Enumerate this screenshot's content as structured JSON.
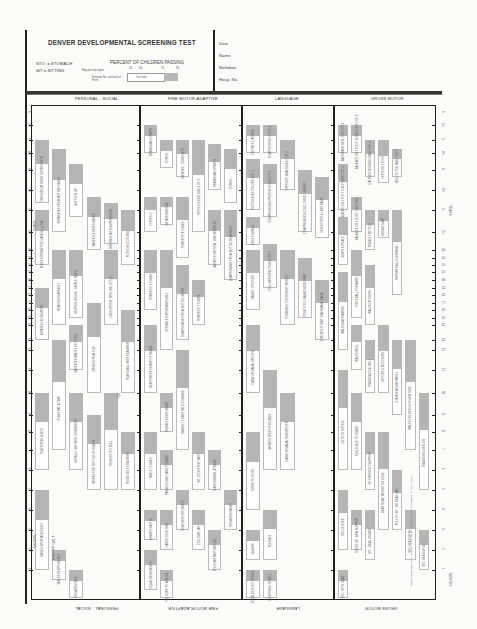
{
  "header": {
    "title": "DENVER DEVELOPMENTAL SCREENING TEST",
    "abbreviations": [
      "STO. = STOMACH",
      "SIT = SITTING"
    ],
    "legend": {
      "title": "PERCENT OF CHILDREN PASSING",
      "percentiles": [
        "25",
        "50",
        "75",
        "90"
      ],
      "report_note": "May pass by report",
      "footnote_note": "Footnote No. see back of Form",
      "test_item_label": "Test Item"
    },
    "fields": [
      "Date",
      "Name",
      "Birthdate",
      "Hosp. No."
    ]
  },
  "sections": [
    {
      "id": "personal-social",
      "label": "PERSONAL - SOCIAL"
    },
    {
      "id": "fine-motor-adaptive",
      "label": "FINE MOTOR-ADAPTIVE"
    },
    {
      "id": "language",
      "label": "LANGUAGE"
    },
    {
      "id": "gross-motor",
      "label": "GROSS MOTOR"
    }
  ],
  "axis": {
    "unit_top": "YEARS",
    "unit_bottom": "MONTHS",
    "year_ticks": [
      "6",
      "5½",
      "5",
      "4½",
      "4",
      "3½",
      "3",
      "2½"
    ],
    "month_ticks": [
      "24",
      "23",
      "22",
      "21",
      "20",
      "19",
      "18",
      "17",
      "16",
      "15",
      "14",
      "13",
      "12",
      "11",
      "10",
      "9",
      "8",
      "7",
      "6",
      "5",
      "4",
      "3",
      "2",
      "1"
    ]
  },
  "footnotes": {
    "ps_note": "★ 100% pass at birth",
    "ps_pct": "50%",
    "copyright": "©1969, William K. Frankenburg, M.D. and Josiah B. Dodds, Ph.D., University of Colorado Medical Center"
  },
  "chart_data": {
    "type": "table",
    "title": "DENVER DEVELOPMENTAL SCREENING TEST",
    "xlabel": "Age (months / years)",
    "note": "Each item is a bar showing age at which 25%, 50%, 75%, 90% of children pass (approx. months)",
    "items": {
      "personal_social": [
        {
          "label": "DRESSES WITHOUT SUPERVISION",
          "p25": 38,
          "p90": 60
        },
        {
          "label": "SEPARATES FROM MOTHER EASILY",
          "p25": 30,
          "p90": 56
        },
        {
          "label": "BUTTONS UP",
          "p25": 34,
          "p90": 50
        },
        {
          "label": "PLAYS INTERACTIVE GAMES e.g. TAG",
          "p25": 22,
          "p90": 36
        },
        {
          "label": "DRESSES WITH SUPERVISION",
          "p25": 26,
          "p90": 38
        },
        {
          "label": "WASHES & DRIES HANDS",
          "p25": 24,
          "p90": 40
        },
        {
          "label": "PUTS ON CLOTHING",
          "p25": 22,
          "p90": 36
        },
        {
          "label": "REMOVES GARMENT",
          "p25": 14,
          "p90": 24
        },
        {
          "label": "HELPS IN HOUSE - SIMPLE TASKS",
          "p25": 15,
          "p90": 24
        },
        {
          "label": "USES SPOON, SPILLING LITTLE",
          "p25": 14,
          "p90": 24
        },
        {
          "label": "IMITATES HOUSEWORK",
          "p25": 13,
          "p90": 19
        },
        {
          "label": "INDICATES WANTS (NOT CRY)",
          "p25": 11,
          "p90": 14
        },
        {
          "label": "PLAYS BALL WITH EXAMINER",
          "p25": 10,
          "p90": 16
        },
        {
          "label": "DRINKS FROM CUP",
          "p25": 10,
          "p90": 17
        },
        {
          "label": "PLAYS PAT-A-CAKE",
          "p25": 7,
          "p90": 13
        },
        {
          "label": "PLAYS PEEK-A-BOO",
          "p25": 6,
          "p90": 10
        },
        {
          "label": "INITIALLY SHY WITH STRANGERS",
          "p25": 6,
          "p90": 10
        },
        {
          "label": "RESISTS TOY PULL",
          "p25": 5,
          "p90": 10
        },
        {
          "label": "FEEDS SELF CRACKERS",
          "p25": 5,
          "p90": 8
        },
        {
          "label": "WORKS FOR TOY OUT OF REACH",
          "p25": 5,
          "p90": 9
        },
        {
          "label": "SMILES SPONTANEOUSLY",
          "p25": 1,
          "p90": 5
        },
        {
          "label": "SMILES RESPONSIVELY",
          "p25": 0.5,
          "p90": 2
        },
        {
          "label": "REGARDS FACE",
          "p25": 0,
          "p90": 1
        }
      ],
      "fine_motor_adaptive": [
        {
          "label": "DRAWS MAN 6 PARTS",
          "p25": 54,
          "p90": 66
        },
        {
          "label": "COPIES □",
          "p25": 52,
          "p90": 60
        },
        {
          "label": "IMITATES □ DEMONSTR.",
          "p25": 46,
          "p90": 60
        },
        {
          "label": "DRAWS MAN 3 PARTS",
          "p25": 42,
          "p90": 58
        },
        {
          "label": "PICKS LONGER LINE 3 OF 3",
          "p25": 30,
          "p90": 60
        },
        {
          "label": "COPIES +",
          "p25": 38,
          "p90": 56
        },
        {
          "label": "COPIES O",
          "p25": 30,
          "p90": 40
        },
        {
          "label": "IMITATES BRIDGE",
          "p25": 32,
          "p90": 40
        },
        {
          "label": "TOWER OF 8 CUBES",
          "p25": 23,
          "p90": 40
        },
        {
          "label": "IMITATES VERTICAL LINE WITHIN 30°",
          "p25": 22,
          "p90": 36
        },
        {
          "label": "DUMPS RAISIN FROM BOTTLE-DEMONSTR.",
          "p25": 20,
          "p90": 36
        },
        {
          "label": "TOWER OF 4 CUBES",
          "p25": 16,
          "p90": 24
        },
        {
          "label": "DUMPS RAISIN FROM BOTTLE-SPONT.",
          "p25": 13,
          "p90": 22
        },
        {
          "label": "TOWER OF 2 CUBES",
          "p25": 14,
          "p90": 20
        },
        {
          "label": "SCRIBBLES SPONTANEOUSLY",
          "p25": 12,
          "p90": 24
        },
        {
          "label": "NEAT PINCER GRASP OF RAISIN",
          "p25": 10,
          "p90": 14
        },
        {
          "label": "BANGS 2 CUBES HELD IN HANDS",
          "p25": 7,
          "p90": 12
        },
        {
          "label": "THUMB-FINGER GRASP",
          "p25": 8,
          "p90": 10
        },
        {
          "label": "PASSES CUBE HAND TO HAND",
          "p25": 5,
          "p90": 7
        },
        {
          "label": "TAKES 2 CUBES",
          "p25": 5,
          "p90": 8
        },
        {
          "label": "SIT, LOOKS FOR YARN",
          "p25": 5,
          "p90": 8
        },
        {
          "label": "RAKES RAISIN, ATTAINS",
          "p25": 5,
          "p90": 7
        },
        {
          "label": "GRASPS RATTLE",
          "p25": 2.5,
          "p90": 4
        },
        {
          "label": "REACHES FOR OBJECT",
          "p25": 3,
          "p90": 5
        },
        {
          "label": "REGARDS RAISIN",
          "p25": 3,
          "p90": 5
        },
        {
          "label": "HANDS TOGETHER",
          "p25": 2,
          "p90": 4
        },
        {
          "label": "FOLLOWS 180°",
          "p25": 2,
          "p90": 4
        },
        {
          "label": "FOLLOWS PAST MIDLINE",
          "p25": 1,
          "p90": 3
        },
        {
          "label": "EQUAL MOVEMENTS",
          "p25": 0,
          "p90": 2
        },
        {
          "label": "FOLLOWS TO MIDLINE",
          "p25": 0,
          "p90": 1
        }
      ],
      "language": [
        {
          "label": "DEFINES 6 WORDS",
          "p25": 60,
          "p90": 66
        },
        {
          "label": "COMPOSITION OF 3 OF 3",
          "p25": 55,
          "p90": 66
        },
        {
          "label": "OPPOSITE ANALOGIES 2 OF 3",
          "p25": 42,
          "p90": 60
        },
        {
          "label": "RECOGNIZES COLORS 3 OF 4",
          "p25": 36,
          "p90": 52
        },
        {
          "label": "COMPREHENDS PREPOSITIONS 3 OF 4",
          "p25": 34,
          "p90": 50
        },
        {
          "label": "COMPREHENDS COLD, TIRED, HUNGRY",
          "p25": 30,
          "p90": 48
        },
        {
          "label": "GIVES FIRST & LAST NAME",
          "p25": 28,
          "p90": 46
        },
        {
          "label": "USES PLURALS",
          "p25": 26,
          "p90": 34
        },
        {
          "label": "FOLLOWS DIRECTIONS 2 OF 3",
          "p25": 19,
          "p90": 26
        },
        {
          "label": "NAMES 1 PICTURE",
          "p25": 16,
          "p90": 24
        },
        {
          "label": "POINTS TO 1 NAMED BODY PART",
          "p25": 15,
          "p90": 23
        },
        {
          "label": "COMBINES 2 DIFFERENT WORDS",
          "p25": 14,
          "p90": 24
        },
        {
          "label": "3 WORDS OTHER THAN MAMA, DADA",
          "p25": 13,
          "p90": 20
        },
        {
          "label": "DADA OR MAMA, SPECIFIC",
          "p25": 10,
          "p90": 14
        },
        {
          "label": "IMITATES SPEECH SOUNDS",
          "p25": 6,
          "p90": 11
        },
        {
          "label": "DADA OR MAMA, NONSPECIFIC",
          "p25": 6,
          "p90": 10
        },
        {
          "label": "TURNS TO VOICE",
          "p25": 4,
          "p90": 8
        },
        {
          "label": "SQUEALS",
          "p25": 1.5,
          "p90": 4
        },
        {
          "label": "LAUGHS",
          "p25": 1.5,
          "p90": 3
        },
        {
          "label": "VOCALIZES NOT CRYING",
          "p25": 0.5,
          "p90": 1
        },
        {
          "label": "RESPONDS TO BELL",
          "p25": 0,
          "p90": 1
        }
      ],
      "gross_motor": [
        {
          "label": "BACKWARD HEEL-TOE 2 OF 3",
          "p25": 56,
          "p90": 66
        },
        {
          "label": "BALANCE ON 1 FOOT 10 SECONDS 2 OF 3",
          "p25": 54,
          "p90": 66
        },
        {
          "label": "CATCHES BOUNCED BALL 2 OF 3",
          "p25": 46,
          "p90": 60
        },
        {
          "label": "HEEL TO TOE WALK 2 OF 3",
          "p25": 46,
          "p90": 56
        },
        {
          "label": "HOPS ON 1 FOOT",
          "p25": 44,
          "p90": 60
        },
        {
          "label": "BALANCE ON 1 FOOT 5 SECONDS 2 OF 3",
          "p25": 36,
          "p90": 50
        },
        {
          "label": "BALANCE ON 1 FOOT 1 SECOND",
          "p25": 30,
          "p90": 40
        },
        {
          "label": "JUMPS IN PLACE",
          "p25": 22,
          "p90": 34
        },
        {
          "label": "PEDALS TRICYCLE",
          "p25": 24,
          "p90": 36
        },
        {
          "label": "BROAD JUMP",
          "p25": 28,
          "p90": 36
        },
        {
          "label": "THROWS BALL OVERHAND",
          "p25": 18,
          "p90": 36
        },
        {
          "label": "KICKS BALL FORWARD",
          "p25": 15,
          "p90": 24
        },
        {
          "label": "WALKS UP STEPS",
          "p25": 14,
          "p90": 22
        },
        {
          "label": "WALKS BACKWARDS",
          "p25": 12,
          "p90": 21
        },
        {
          "label": "WALKS WELL",
          "p25": 11,
          "p90": 14
        },
        {
          "label": "STOOPS & RECOVERS",
          "p25": 10,
          "p90": 14
        },
        {
          "label": "STANDS ALONE WELL",
          "p25": 10,
          "p90": 13
        },
        {
          "label": "STANDS MOMENTARILY",
          "p25": 9,
          "p90": 13
        },
        {
          "label": "WALKS HOLDING ON FURNITURE",
          "p25": 7,
          "p90": 13
        },
        {
          "label": "PULLS SELF TO STAND",
          "p25": 6,
          "p90": 10
        },
        {
          "label": "GETS TO SITTING",
          "p25": 6,
          "p90": 11
        },
        {
          "label": "STANDS HOLDING ON",
          "p25": 5,
          "p90": 10
        },
        {
          "label": "SITS WITHOUT SUPPORT",
          "p25": 5,
          "p90": 8
        },
        {
          "label": "BEAR SOME WEIGHT ON LEGS",
          "p25": 3,
          "p90": 8
        },
        {
          "label": "ROLLS OVER",
          "p25": 2,
          "p90": 5
        },
        {
          "label": "CHEST UP - ARM SUPPORT",
          "p25": 2,
          "p90": 4
        },
        {
          "label": "SIT - HEAD STEADY",
          "p25": 1.5,
          "p90": 4
        },
        {
          "label": "PULL TO SIT - NO HEAD LAG",
          "p25": 3,
          "p90": 6
        },
        {
          "label": "STO. HEAD UP 90°",
          "p25": 1.5,
          "p90": 4
        },
        {
          "label": "STO. HEAD UP 45°",
          "p25": 1,
          "p90": 3
        },
        {
          "label": "STO. LIFTS HEAD",
          "p25": 0,
          "p90": 1
        }
      ]
    }
  }
}
